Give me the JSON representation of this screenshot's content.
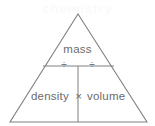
{
  "diagram": {
    "type": "formula-triangle",
    "background_color": "#ffffff",
    "stroke_color": "#808080",
    "text_color": "#6b6b6b",
    "top_cell": {
      "label": "mass"
    },
    "operators": {
      "divide_left": "÷",
      "divide_right": "÷",
      "multiply": "×"
    },
    "bottom_left_cell": {
      "label": "density"
    },
    "bottom_right_cell": {
      "label": "volume"
    },
    "watermark": "chemistry"
  },
  "geometry": {
    "apex": "78,14",
    "base_left": "10,122",
    "base_right": "147,122",
    "divider_horizontal": "43,66 114,66",
    "divider_vertical": "78,66 78,122"
  }
}
